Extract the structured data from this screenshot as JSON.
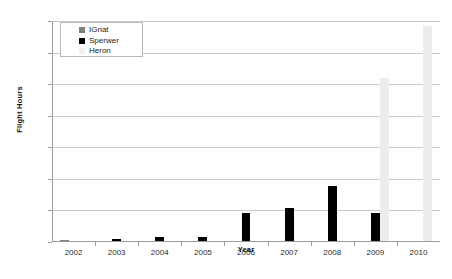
{
  "chart_data": {
    "type": "bar",
    "title": "",
    "xlabel": "Year",
    "ylabel": "Flight Hours",
    "categories": [
      "2002",
      "2003",
      "2004",
      "2005",
      "2006",
      "2007",
      "2008",
      "2009",
      "2010"
    ],
    "ylim": [
      0,
      7000
    ],
    "ytick_values": [
      0,
      1000,
      2000,
      3000,
      4000,
      5000,
      6000,
      7000
    ],
    "ytick_labels": [
      "0",
      "1,000",
      "2,000",
      "3,000",
      "4,000",
      "5,000",
      "6,000",
      "7,000"
    ],
    "grid": true,
    "legend_position": "upper left",
    "series": [
      {
        "name": "IGnat",
        "color": "#808080",
        "values": [
          30,
          0,
          0,
          0,
          0,
          0,
          0,
          0,
          0
        ]
      },
      {
        "name": "Sperwer",
        "color": "#000000",
        "values": [
          0,
          50,
          120,
          130,
          900,
          1050,
          1740,
          900,
          0
        ]
      },
      {
        "name": "Heron",
        "color": "#ececec",
        "values": [
          0,
          0,
          0,
          0,
          0,
          0,
          0,
          5150,
          6800
        ]
      }
    ]
  },
  "legend": {
    "entries": [
      {
        "label": "IGnat",
        "color": "#808080"
      },
      {
        "label": "Sperwer",
        "color": "#000000"
      },
      {
        "label": "Heron",
        "color": "#efefef"
      }
    ]
  }
}
